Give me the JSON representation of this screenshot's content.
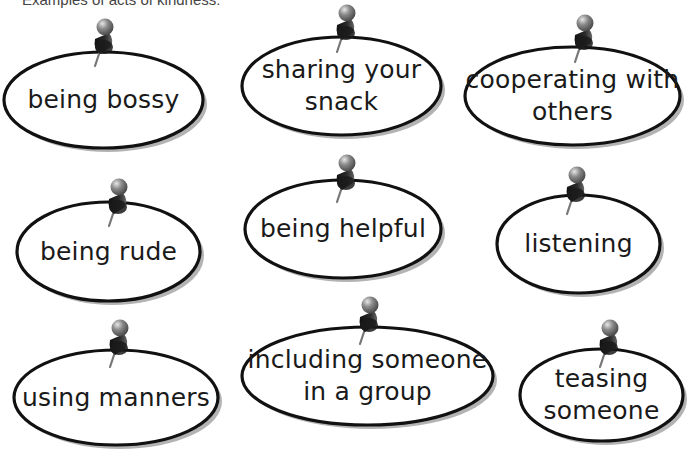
{
  "heading": "Examples of acts of kindness:",
  "colors": {
    "outline": "#111111",
    "shadow": "#9a9a9a",
    "pin_head": "#8a8a8a",
    "pin_body": "#2a2a2a",
    "pin_needle": "#777777"
  },
  "cards": [
    {
      "id": "being-bossy",
      "lines": [
        "being bossy"
      ],
      "oval": {
        "x": 2,
        "y": 50,
        "w": 203,
        "h": 100
      },
      "pin": {
        "x": 103,
        "y": 27
      }
    },
    {
      "id": "sharing-your-snack",
      "lines": [
        "sharing your",
        "snack"
      ],
      "oval": {
        "x": 240,
        "y": 35,
        "w": 203,
        "h": 102
      },
      "pin": {
        "x": 345,
        "y": 13
      }
    },
    {
      "id": "cooperating-with-others",
      "lines": [
        "cooperating with",
        "others"
      ],
      "oval": {
        "x": 463,
        "y": 45,
        "w": 219,
        "h": 102
      },
      "pin": {
        "x": 583,
        "y": 23
      }
    },
    {
      "id": "being-rude",
      "lines": [
        "being rude"
      ],
      "oval": {
        "x": 15,
        "y": 200,
        "w": 187,
        "h": 103
      },
      "pin": {
        "x": 117,
        "y": 187
      }
    },
    {
      "id": "being-helpful",
      "lines": [
        "being helpful"
      ],
      "oval": {
        "x": 243,
        "y": 178,
        "w": 200,
        "h": 102
      },
      "pin": {
        "x": 345,
        "y": 163
      }
    },
    {
      "id": "listening",
      "lines": [
        "listening"
      ],
      "oval": {
        "x": 495,
        "y": 193,
        "w": 167,
        "h": 102
      },
      "pin": {
        "x": 575,
        "y": 175
      }
    },
    {
      "id": "using-manners",
      "lines": [
        "using manners"
      ],
      "oval": {
        "x": 12,
        "y": 348,
        "w": 208,
        "h": 99
      },
      "pin": {
        "x": 118,
        "y": 328
      }
    },
    {
      "id": "including-someone-in-a-group",
      "lines": [
        "including someone",
        "in a group"
      ],
      "oval": {
        "x": 240,
        "y": 325,
        "w": 255,
        "h": 102
      },
      "pin": {
        "x": 368,
        "y": 305
      }
    },
    {
      "id": "teasing-someone",
      "lines": [
        "teasing",
        "someone"
      ],
      "oval": {
        "x": 518,
        "y": 347,
        "w": 167,
        "h": 96
      },
      "pin": {
        "x": 608,
        "y": 328
      }
    }
  ]
}
